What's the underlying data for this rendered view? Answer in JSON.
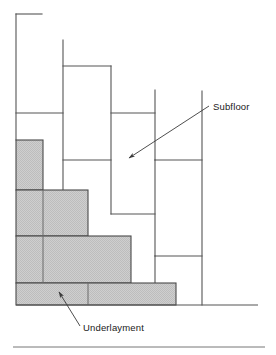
{
  "figure": {
    "name": "subfloor-underlayment-cross-section",
    "background_color": "#ffffff"
  },
  "colors": {
    "line": "#555555",
    "line_dark": "#3a3a3a",
    "underlayment_fill": "#c8c8c8",
    "text": "#1a1a1a",
    "rule": "#777777"
  },
  "labels": {
    "subfloor": "Subfloor",
    "underlayment": "Underlayment"
  },
  "callouts": [
    {
      "name": "subfloor-callout",
      "label": "Subfloor",
      "text_x": 213,
      "text_y": 110,
      "leader_start_x": 209,
      "leader_start_y": 106,
      "leader_end_x": 129,
      "leader_end_y": 158,
      "arrow_at": "end"
    },
    {
      "name": "underlayment-callout",
      "label": "Underlayment",
      "text_x": 83,
      "text_y": 331,
      "leader_start_x": 80,
      "leader_start_y": 326,
      "leader_end_x": 59,
      "leader_end_y": 292,
      "arrow_at": "end"
    }
  ],
  "underlayment_steps": [
    {
      "name": "step-1-top",
      "x": 16,
      "y": 140,
      "width": 27,
      "height": 50
    },
    {
      "name": "step-2",
      "x": 16,
      "y": 190,
      "width": 72,
      "height": 46
    },
    {
      "name": "step-3",
      "x": 16,
      "y": 236,
      "width": 115,
      "height": 47
    },
    {
      "name": "step-4-bottom",
      "x": 16,
      "y": 283,
      "width": 160,
      "height": 22
    }
  ],
  "underlayment_joints": [
    {
      "name": "joint-step2-vertical",
      "x1": 43,
      "y1": 190,
      "x2": 43,
      "y2": 236
    },
    {
      "name": "joint-step3-vertical",
      "x1": 43,
      "y1": 236,
      "x2": 43,
      "y2": 283
    },
    {
      "name": "joint-step4-vertical",
      "x1": 88,
      "y1": 283,
      "x2": 88,
      "y2": 305
    }
  ],
  "subfloor_lines": [
    {
      "name": "subfloor-left-edge-vertical",
      "x1": 16,
      "y1": 14,
      "x2": 16,
      "y2": 140
    },
    {
      "name": "subfloor-top-left-horizontal",
      "x1": 16,
      "y1": 14,
      "x2": 42,
      "y2": 14
    },
    {
      "name": "subfloor-panel-a-vertical",
      "x1": 63,
      "y1": 40,
      "x2": 63,
      "y2": 190
    },
    {
      "name": "subfloor-panel-a-horizontal",
      "x1": 16,
      "y1": 113,
      "x2": 63,
      "y2": 113
    },
    {
      "name": "subfloor-panel-b-top",
      "x1": 63,
      "y1": 66,
      "x2": 111,
      "y2": 66
    },
    {
      "name": "subfloor-panel-b-vertical",
      "x1": 111,
      "y1": 66,
      "x2": 111,
      "y2": 214
    },
    {
      "name": "subfloor-panel-c-horizontal",
      "x1": 63,
      "y1": 160,
      "x2": 111,
      "y2": 160
    },
    {
      "name": "subfloor-panel-d-horizontal",
      "x1": 111,
      "y1": 113,
      "x2": 155,
      "y2": 113
    },
    {
      "name": "subfloor-panel-d-vertical",
      "x1": 155,
      "y1": 90,
      "x2": 155,
      "y2": 160
    },
    {
      "name": "subfloor-panel-e-horizontal",
      "x1": 111,
      "y1": 214,
      "x2": 155,
      "y2": 214
    },
    {
      "name": "subfloor-panel-f-vertical",
      "x1": 155,
      "y1": 160,
      "x2": 155,
      "y2": 256
    },
    {
      "name": "subfloor-panel-f-horizontal",
      "x1": 155,
      "y1": 160,
      "x2": 202,
      "y2": 160
    },
    {
      "name": "subfloor-right-edge-vertical",
      "x1": 202,
      "y1": 91,
      "x2": 202,
      "y2": 305
    },
    {
      "name": "subfloor-panel-g-horizontal",
      "x1": 155,
      "y1": 256,
      "x2": 202,
      "y2": 256
    },
    {
      "name": "subfloor-panel-g-vertical",
      "x1": 155,
      "y1": 256,
      "x2": 155,
      "y2": 283
    }
  ],
  "baseline": {
    "name": "floor-baseline",
    "x1": 16,
    "y1": 305,
    "x2": 258,
    "y2": 305
  },
  "bottom_rule": {
    "name": "figure-bottom-rule",
    "x1": 13,
    "y1": 347,
    "x2": 265,
    "y2": 347
  }
}
